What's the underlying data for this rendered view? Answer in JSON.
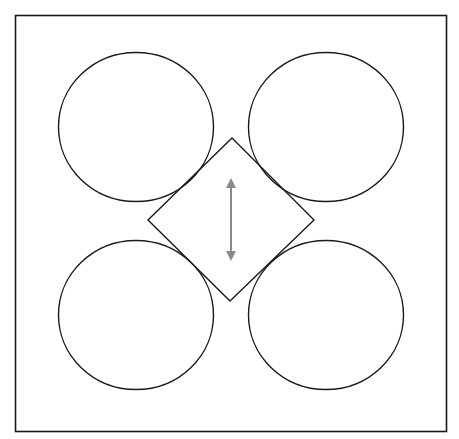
{
  "diagram": {
    "width": 459,
    "height": 439,
    "colors": {
      "background": "#ffffff",
      "stroke": "#1a1a1a",
      "arrow": "#8a8a8a"
    },
    "frame": {
      "x": 15.5,
      "y": 15.5,
      "width": 431,
      "height": 416
    },
    "circles": [
      {
        "id": "top-left",
        "cx": 136,
        "cy": 127,
        "rx": 77.5,
        "ry": 74.5
      },
      {
        "id": "top-right",
        "cx": 326,
        "cy": 127,
        "rx": 77.5,
        "ry": 74.5
      },
      {
        "id": "bottom-left",
        "cx": 136,
        "cy": 315,
        "rx": 77.5,
        "ry": 74.5
      },
      {
        "id": "bottom-right",
        "cx": 326,
        "cy": 315,
        "rx": 77.5,
        "ry": 74.5
      }
    ],
    "diamond": {
      "points": "232,138 314,220 230,301 148,220"
    },
    "arrow": {
      "x": 231,
      "y1": 178,
      "y2": 261,
      "head": 10,
      "direction": "bidirectional-vertical"
    }
  }
}
